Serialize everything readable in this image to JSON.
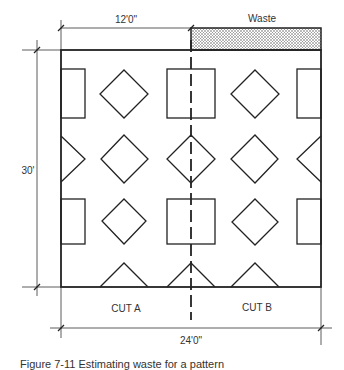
{
  "dimensions": {
    "top_width": "12'0\"",
    "total_width": "24'0\"",
    "height": "30'"
  },
  "labels": {
    "waste": "Waste",
    "cut_a": "CUT A",
    "cut_b": "CUT B"
  },
  "caption": "Figure 7-11 Estimating waste for a pattern",
  "colors": {
    "line": "#222222",
    "text": "#333333",
    "background": "#ffffff"
  }
}
